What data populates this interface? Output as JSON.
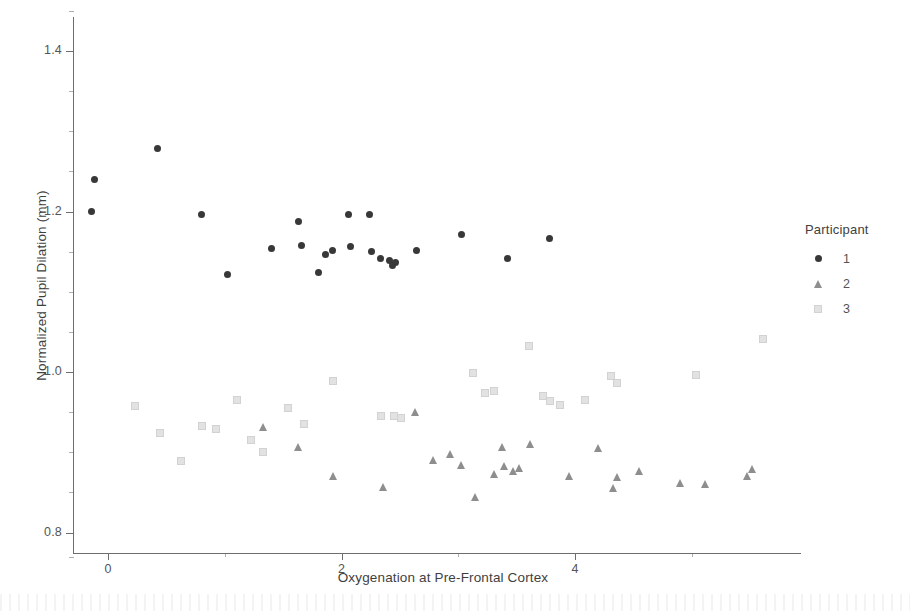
{
  "figure": {
    "title": "",
    "noise_band": true
  },
  "axes": {
    "x": {
      "label": "Oxygenation at Pre-Frontal Cortex",
      "ticks": [
        {
          "value": 0,
          "label": "0"
        },
        {
          "value": 2,
          "label": "2"
        },
        {
          "value": 4,
          "label": "4"
        }
      ],
      "minor_ticks": [
        1,
        3,
        5
      ],
      "range": [
        -0.55,
        5.9
      ]
    },
    "y": {
      "label": "Normalized Pupil Dilation (mm)",
      "ticks": [
        {
          "value": 1.4,
          "label": "1.4"
        },
        {
          "value": 1.2,
          "label": "1.2"
        },
        {
          "value": 1.0,
          "label": "1.0"
        },
        {
          "value": 0.8,
          "label": "0.8"
        }
      ],
      "minor_ticks": [
        1.45,
        1.35,
        1.3,
        1.25,
        1.15,
        1.1,
        1.05,
        0.95,
        0.9,
        0.85,
        0.77
      ],
      "range": [
        0.765,
        1.455
      ]
    }
  },
  "legend": {
    "title": "Participant",
    "position": "right",
    "entries": [
      {
        "label": "1",
        "marker": "circle",
        "color": "#383838"
      },
      {
        "label": "2",
        "marker": "triangle",
        "color": "#8e8e8e"
      },
      {
        "label": "3",
        "marker": "square",
        "color": "#e2e2e2"
      }
    ]
  },
  "chart_data": {
    "type": "scatter",
    "title": "",
    "xlabel": "Oxygenation at Pre-Frontal Cortex",
    "ylabel": "Normalized Pupil Dilation (mm)",
    "xlim": [
      -0.55,
      5.9
    ],
    "ylim": [
      0.765,
      1.455
    ],
    "grid": false,
    "legend_position": "right",
    "legend_title": "Participant",
    "series": [
      {
        "name": "1",
        "marker": "circle",
        "color": "#383838",
        "points": [
          [
            -0.12,
            1.24
          ],
          [
            -0.14,
            1.2
          ],
          [
            0.42,
            1.278
          ],
          [
            0.8,
            1.196
          ],
          [
            1.02,
            1.121
          ],
          [
            1.4,
            1.154
          ],
          [
            1.63,
            1.188
          ],
          [
            1.66,
            1.158
          ],
          [
            1.8,
            1.124
          ],
          [
            1.86,
            1.147
          ],
          [
            1.92,
            1.151
          ],
          [
            2.06,
            1.196
          ],
          [
            2.08,
            1.157
          ],
          [
            2.24,
            1.196
          ],
          [
            2.26,
            1.15
          ],
          [
            2.33,
            1.141
          ],
          [
            2.41,
            1.139
          ],
          [
            2.44,
            1.133
          ],
          [
            2.46,
            1.137
          ],
          [
            2.64,
            1.152
          ],
          [
            3.03,
            1.171
          ],
          [
            3.42,
            1.141
          ],
          [
            3.78,
            1.167
          ]
        ]
      },
      {
        "name": "2",
        "marker": "triangle",
        "color": "#8e8e8e",
        "points": [
          [
            1.33,
            0.931
          ],
          [
            1.63,
            0.907
          ],
          [
            1.93,
            0.871
          ],
          [
            2.36,
            0.857
          ],
          [
            2.63,
            0.95
          ],
          [
            2.79,
            0.89
          ],
          [
            2.93,
            0.898
          ],
          [
            3.03,
            0.884
          ],
          [
            3.15,
            0.844
          ],
          [
            3.31,
            0.873
          ],
          [
            3.38,
            0.907
          ],
          [
            3.4,
            0.883
          ],
          [
            3.47,
            0.877
          ],
          [
            3.52,
            0.88
          ],
          [
            3.62,
            0.91
          ],
          [
            3.95,
            0.87
          ],
          [
            4.2,
            0.905
          ],
          [
            4.33,
            0.855
          ],
          [
            4.36,
            0.869
          ],
          [
            4.55,
            0.877
          ],
          [
            4.9,
            0.862
          ],
          [
            5.12,
            0.86
          ],
          [
            5.48,
            0.87
          ],
          [
            5.52,
            0.879
          ]
        ]
      },
      {
        "name": "3",
        "marker": "square",
        "color": "#e2e2e2",
        "points": [
          [
            0.22,
            0.959
          ],
          [
            0.44,
            0.925
          ],
          [
            0.62,
            0.89
          ],
          [
            0.8,
            0.934
          ],
          [
            0.92,
            0.93
          ],
          [
            1.1,
            0.967
          ],
          [
            1.22,
            0.917
          ],
          [
            1.32,
            0.902
          ],
          [
            1.53,
            0.957
          ],
          [
            1.67,
            0.937
          ],
          [
            1.92,
            0.99
          ],
          [
            2.33,
            0.947
          ],
          [
            2.44,
            0.946
          ],
          [
            2.5,
            0.944
          ],
          [
            3.12,
            1.0
          ],
          [
            3.22,
            0.975
          ],
          [
            3.3,
            0.978
          ],
          [
            3.6,
            1.034
          ],
          [
            3.72,
            0.971
          ],
          [
            3.78,
            0.965
          ],
          [
            3.86,
            0.96
          ],
          [
            4.08,
            0.966
          ],
          [
            4.3,
            0.996
          ],
          [
            4.35,
            0.988
          ],
          [
            5.03,
            0.998
          ],
          [
            5.6,
            1.043
          ]
        ]
      }
    ]
  }
}
